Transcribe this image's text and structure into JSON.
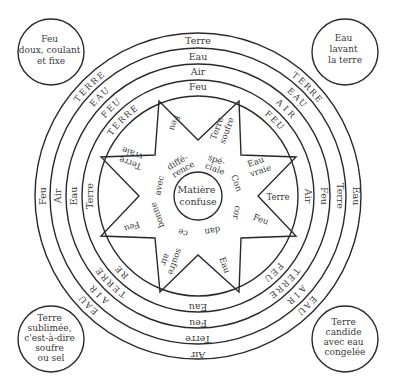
{
  "diagram": {
    "center_circle": {
      "lines": [
        "Matière",
        "confuse"
      ]
    },
    "corners": {
      "top_left": {
        "lines": [
          "Feu",
          "doux, coulant",
          "et fixe"
        ]
      },
      "top_right": {
        "lines": [
          "Eau",
          "lavant",
          "la terre"
        ]
      },
      "bottom_left": {
        "lines": [
          "Terre",
          "sublimée,",
          "c'est-à-dire",
          "soufre",
          "ou sel"
        ]
      },
      "bottom_right": {
        "lines": [
          "Terre",
          "candide",
          "avec eau",
          "congelée"
        ]
      }
    },
    "rings": {
      "top": [
        "Terre",
        "Eau",
        "Air",
        "Feu"
      ],
      "right": [
        "Eau",
        "Terre",
        "Feu",
        "Air"
      ],
      "bottom": [
        "Air",
        "Terre",
        "Feu",
        "Eau"
      ],
      "left": [
        "Feu",
        "Air",
        "Eau",
        "Terre"
      ]
    },
    "diagonal_letters": {
      "top_left": [
        "TERRE",
        "EAU",
        "FEU",
        "TERRE"
      ],
      "top_right": [
        "TERRE",
        "EAU",
        "AIR",
        "FEU"
      ],
      "bottom_left": [
        "EAU",
        "AIR",
        "TERRE",
        "RE"
      ],
      "bottom_right": [
        "EAU",
        "AIR",
        "TERRE",
        "FEU"
      ]
    },
    "star_points": {
      "top_left": "Feu",
      "top_right": [
        "Terre",
        "soufre"
      ],
      "right_upper": [
        "Eau",
        "vraie"
      ],
      "right": "Terre",
      "right_lower": "Feu",
      "bottom_right": "Eau",
      "bottom_left": [
        "soufre",
        "air"
      ],
      "left_lower": "Feu",
      "left_upper": [
        "Terre",
        "vraie"
      ]
    },
    "inner_words": {
      "diffe": [
        "diffé-",
        "rence"
      ],
      "speciale": [
        "spé-",
        "ciale"
      ],
      "con": "Con",
      "cor": "cor",
      "dan": "dan",
      "ce": "ce",
      "bonne": "bonne",
      "avec": "avec"
    }
  }
}
